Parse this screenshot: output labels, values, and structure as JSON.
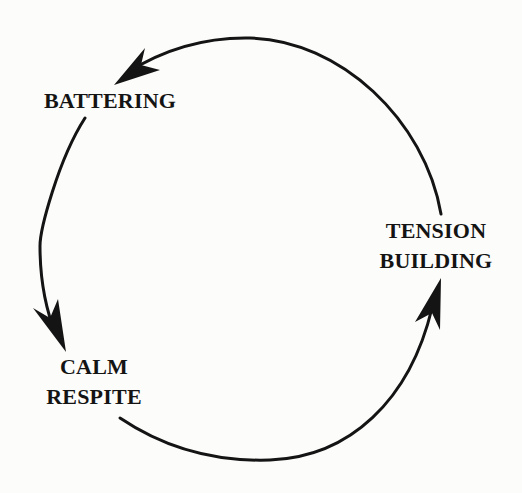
{
  "diagram": {
    "type": "cycle",
    "direction": "counterclockwise",
    "colors": {
      "background": "#fcfcfa",
      "ink": "#141414"
    },
    "stages": [
      {
        "id": "battering",
        "lines": [
          "BATTERING"
        ]
      },
      {
        "id": "calm-respite",
        "lines": [
          "CALM",
          "RESPITE"
        ]
      },
      {
        "id": "tension-building",
        "lines": [
          "TENSION",
          "BUILDING"
        ]
      }
    ],
    "arrows": [
      {
        "from": "tension-building",
        "to": "battering"
      },
      {
        "from": "battering",
        "to": "calm-respite"
      },
      {
        "from": "calm-respite",
        "to": "tension-building"
      }
    ]
  }
}
